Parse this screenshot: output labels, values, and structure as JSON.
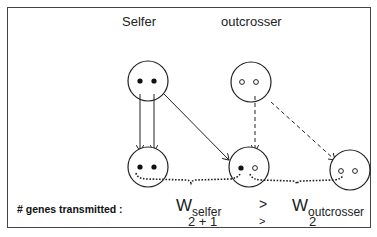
{
  "labels": {
    "selfer": "Selfer",
    "outcrosser": "outcrosser",
    "genes_transmitted": "# genes transmitted :"
  },
  "fitness": {
    "w_symbol": "W",
    "selfer_sub": "selfer",
    "outcrosser_sub": "outcrosser",
    "comparator": ">",
    "selfer_value": "2 + 1",
    "outcrosser_value": "2",
    "value_comparator": ">"
  },
  "nodes": {
    "selfer_parent": {
      "alleles": [
        "filled",
        "filled"
      ]
    },
    "outcrosser_parent": {
      "alleles": [
        "open",
        "open"
      ]
    },
    "selfed_offspring": {
      "alleles": [
        "filled",
        "filled"
      ]
    },
    "hybrid_offspring": {
      "alleles": [
        "filled",
        "open"
      ]
    },
    "outcrossed_offspring": {
      "alleles": [
        "open",
        "open"
      ]
    }
  },
  "colors": {
    "stroke": "#222222",
    "background": "#ffffff"
  }
}
